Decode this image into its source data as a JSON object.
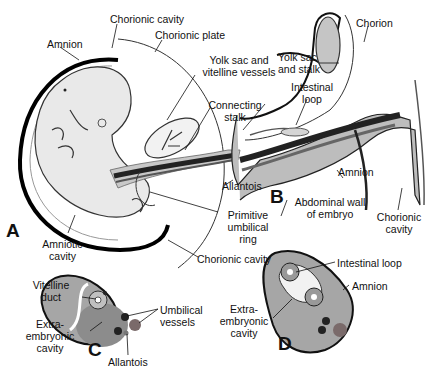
{
  "figure": {
    "panels": [
      {
        "id": "A",
        "label": "A"
      },
      {
        "id": "B",
        "label": "B"
      },
      {
        "id": "C",
        "label": "C"
      },
      {
        "id": "D",
        "label": "D"
      }
    ],
    "labels_A": {
      "chorionic_cavity_top": "Chorionic cavity",
      "chorionic_plate": "Chorionic plate",
      "amnion": "Amnion",
      "yolk_sac_1": "Yolk sac and",
      "yolk_sac_2": "vitelline vessels",
      "connecting_1": "Connecting",
      "connecting_2": "stalk",
      "allantois": "Allantois",
      "primitive_1": "Primitive",
      "primitive_2": "umbilical",
      "primitive_3": "ring",
      "amniotic_1": "Amniotic",
      "amniotic_2": "cavity",
      "chorionic_cavity_bottom": "Chorionic cavity"
    },
    "labels_B": {
      "chorion": "Chorion",
      "yolk_stalk_1": "Yolk sac",
      "yolk_stalk_2": "and stalk",
      "intestinal_1": "Intestinal",
      "intestinal_2": "loop",
      "amnion": "Amnion",
      "abdominal_1": "Abdominal wall",
      "abdominal_2": "of embryo",
      "chorionic_1": "Chorionic",
      "chorionic_2": "cavity"
    },
    "labels_C": {
      "vitelline_1": "Vitelline",
      "vitelline_2": "duct",
      "extra_1": "Extra-",
      "extra_2": "embryonic",
      "extra_3": "cavity",
      "umbilical_1": "Umbilical",
      "umbilical_2": "vessels",
      "allantois": "Allantois"
    },
    "labels_D": {
      "intestinal_loop": "Intestinal loop",
      "amnion": "Amnion",
      "extra_1": "Extra-",
      "extra_2": "embryonic",
      "extra_3": "cavity"
    },
    "colors": {
      "ink": "#111111",
      "gray_light": "#c8c8c8",
      "gray_mid": "#9a9a9a",
      "gray_dark": "#555555",
      "vessel": "#222222",
      "vessel_red": "#7a6a6a"
    }
  }
}
